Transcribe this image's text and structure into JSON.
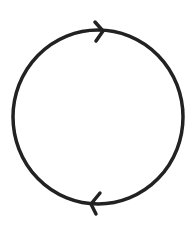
{
  "diagram": {
    "type": "cycle",
    "direction": "clockwise",
    "stroke_color": "#222222",
    "background": "#ffffff",
    "circle": {
      "cx": 98,
      "cy": 117,
      "rx": 85,
      "ry": 87,
      "stroke_width": 3.5
    },
    "arrows": [
      {
        "position": "top",
        "points_toward": "right",
        "tip": [
          103,
          31
        ]
      },
      {
        "position": "bottom",
        "points_toward": "left",
        "tip": [
          90,
          204
        ]
      }
    ]
  }
}
